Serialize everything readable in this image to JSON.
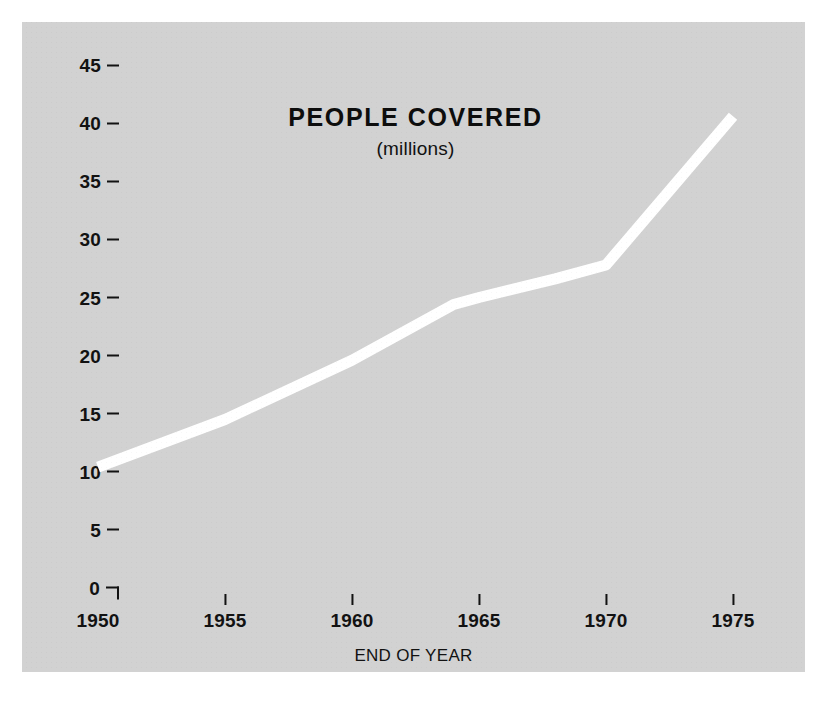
{
  "chart_data": {
    "type": "line",
    "title": "PEOPLE COVERED",
    "subtitle": "(millions)",
    "xlabel": "END OF YEAR",
    "ylabel": "",
    "x": [
      1950,
      1955,
      1960,
      1964,
      1965,
      1968,
      1970,
      1975
    ],
    "values": [
      10.4,
      14.5,
      19.6,
      24.4,
      25.0,
      26.6,
      27.8,
      40.6
    ],
    "series": [
      {
        "name": "People covered (millions)",
        "values": [
          10.4,
          14.5,
          19.6,
          24.4,
          25.0,
          26.6,
          27.8,
          40.6
        ]
      }
    ],
    "xlim": [
      1950,
      1976.5
    ],
    "ylim": [
      0,
      46.5
    ],
    "xticks": [
      1950,
      1955,
      1960,
      1965,
      1970,
      1975
    ],
    "xtick_labels": [
      "1950",
      "1955",
      "1960",
      "1965",
      "1970",
      "1975"
    ],
    "yticks": [
      0,
      5,
      10,
      15,
      20,
      25,
      30,
      35,
      40,
      45
    ],
    "ytick_labels": [
      "0",
      "5",
      "10",
      "15",
      "20",
      "25",
      "30",
      "35",
      "40",
      "45"
    ],
    "grid": false,
    "legend": false,
    "line_color": "#ffffff",
    "line_width_px": 11,
    "background_color": "#d2d2d2",
    "figure_color": "#ffffff",
    "text_color": "#121212"
  }
}
